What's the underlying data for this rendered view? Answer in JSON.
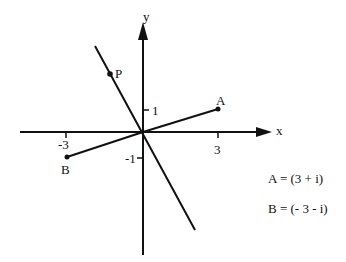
{
  "diagram": {
    "type": "complex-plane",
    "axes": {
      "x_label": "x",
      "y_label": "y",
      "ticks": {
        "x_pos": "3",
        "x_neg": "-3",
        "y_pos": "1",
        "y_neg": "-1"
      }
    },
    "points": {
      "A": {
        "label": "A",
        "x": 3,
        "y": 1
      },
      "B": {
        "label": "B",
        "x": -3,
        "y": -1
      },
      "P": {
        "label": "P"
      }
    },
    "equations": {
      "a": "A = (3 + i)",
      "b": "B = (- 3 - i)"
    },
    "colors": {
      "ink": "#111111",
      "background": "#ffffff"
    }
  }
}
